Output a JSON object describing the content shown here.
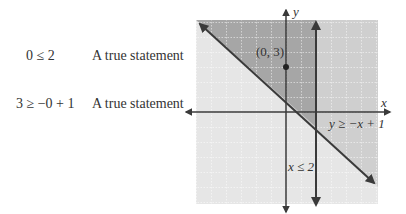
{
  "statements": [
    {
      "equation": "0 ≤ 2",
      "description": "A true statement"
    },
    {
      "equation": "3 ≥ −0 + 1",
      "description": "A true statement"
    }
  ],
  "graph": {
    "x_axis_label": "x",
    "y_axis_label": "y",
    "point_label": "(0, 3)",
    "point": {
      "x": 0,
      "y": 3
    },
    "line1_label": "y ≥ −x + 1",
    "line2_label": "x ≤ 2",
    "x_range": [
      -6,
      6
    ],
    "y_range": [
      -6,
      6
    ],
    "colors": {
      "grid_bg": "#e6e6e6",
      "light_shade": "#cfcfcf",
      "dark_shade": "#a6a6a6",
      "line": "#3a3a3a"
    }
  }
}
